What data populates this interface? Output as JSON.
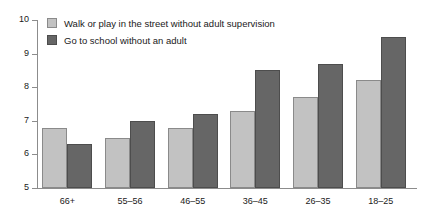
{
  "chart_data": {
    "type": "bar",
    "title": "",
    "subtitle": "",
    "xlabel": "",
    "ylabel": "",
    "categories": [
      "66+",
      "55–56",
      "46–55",
      "36–45",
      "26–35",
      "18–25"
    ],
    "series": [
      {
        "name": "Walk or play in the street without adult supervision",
        "color": "#c2c2c2",
        "values": [
          6.8,
          6.5,
          6.8,
          7.3,
          7.7,
          8.2
        ]
      },
      {
        "name": "Go to school without an adult",
        "color": "#666666",
        "values": [
          6.3,
          7.0,
          7.2,
          8.5,
          8.7,
          9.5
        ]
      }
    ],
    "ylim": [
      5,
      10
    ],
    "yticks": [
      5,
      6,
      7,
      8,
      9,
      10
    ],
    "ytick_labels": [
      "5",
      "6",
      "7",
      "8",
      "9",
      "10"
    ],
    "grid": false,
    "legend_position": "top-left",
    "axis_color": "#8c8c8c",
    "background": "#ffffff"
  },
  "legend": {
    "items": [
      {
        "label": "Walk or play in the street without adult supervision"
      },
      {
        "label": "Go to school without an adult"
      }
    ]
  }
}
